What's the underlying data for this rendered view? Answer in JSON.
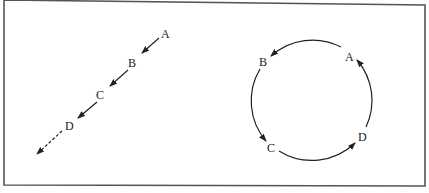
{
  "figure": {
    "border_color": "#555555",
    "line_color": "#222222",
    "left_panel": {
      "name": "linear-sequence",
      "labels": [
        "A",
        "B",
        "C",
        "D"
      ],
      "description_points": [
        {
          "label": "A",
          "x": 167,
          "y": 34
        },
        {
          "label": "B",
          "x": 133,
          "y": 62
        },
        {
          "label": "C",
          "x": 101,
          "y": 95
        },
        {
          "label": "D",
          "x": 70,
          "y": 125
        }
      ]
    },
    "right_panel": {
      "name": "cyclic-sequence",
      "labels": [
        "A",
        "B",
        "C",
        "D"
      ],
      "center": [
        311,
        100
      ],
      "radius": 62
    }
  }
}
